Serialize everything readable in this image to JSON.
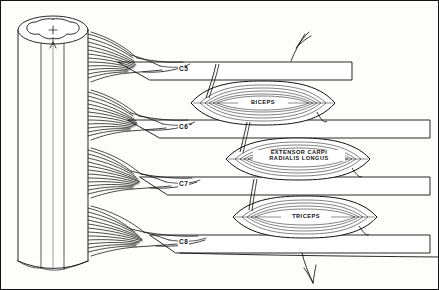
{
  "figure": {
    "background_color": "#fdfdfc",
    "ink_color": "#111111"
  },
  "spinal_cord": {
    "name": "spinal-cord",
    "gray_matter_shape": "butterfly",
    "segments_shown": 4
  },
  "nerve_roots": [
    {
      "label": "C5",
      "y": 71,
      "bar_top": 62,
      "bar_right": 352
    },
    {
      "label": "C6",
      "y": 129,
      "bar_top": 120,
      "bar_right": 430
    },
    {
      "label": "C7",
      "y": 186,
      "bar_top": 177,
      "bar_right": 430
    },
    {
      "label": "C8",
      "y": 244,
      "bar_top": 235,
      "bar_right": 430
    }
  ],
  "muscles": [
    {
      "name": "biceps",
      "lines": [
        "BICEPS"
      ],
      "cx": 263,
      "cy": 103,
      "rx": 72,
      "ry": 22,
      "innervation": "C5"
    },
    {
      "name": "extensor-carpi-radialis-longus",
      "lines": [
        "EXTENSOR  CARPI",
        "RADIALIS  LONGUS"
      ],
      "cx": 298,
      "cy": 159,
      "rx": 72,
      "ry": 21,
      "innervation": "C6"
    },
    {
      "name": "triceps",
      "lines": [
        "TRICEPS"
      ],
      "cx": 305,
      "cy": 217,
      "rx": 72,
      "ry": 21,
      "innervation": "C7"
    }
  ]
}
